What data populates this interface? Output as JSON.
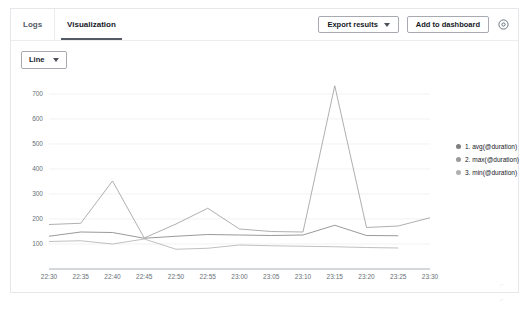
{
  "header": {
    "tabs": [
      {
        "label": "Logs",
        "active": false
      },
      {
        "label": "Visualization",
        "active": true
      }
    ],
    "export_button": "Export results",
    "dashboard_button": "Add to dashboard",
    "settings_icon": "gear-icon"
  },
  "controls": {
    "chart_type": "Line",
    "chart_type_caret": "chevron-down-icon"
  },
  "chart_data": {
    "type": "line",
    "title": "",
    "xlabel": "",
    "ylabel": "",
    "grid": true,
    "legend_position": "right",
    "ylim": [
      0,
      760
    ],
    "yticks": [
      100,
      200,
      300,
      400,
      500,
      600,
      700
    ],
    "x": [
      "22:30",
      "22:35",
      "22:40",
      "22:45",
      "22:50",
      "22:55",
      "23:00",
      "23:05",
      "23:10",
      "23:15",
      "23:20",
      "23:25",
      "23:30"
    ],
    "series": [
      {
        "name": "1. avg(@duration)",
        "color": "#7f7f7f",
        "values": [
          131,
          148,
          146,
          123,
          131,
          138,
          136,
          134,
          136,
          175,
          134,
          133,
          null
        ]
      },
      {
        "name": "2. max(@duration)",
        "color": "#9a9a9a",
        "values": [
          178,
          183,
          352,
          124,
          180,
          243,
          160,
          150,
          148,
          733,
          166,
          172,
          205
        ]
      },
      {
        "name": "3. min(@duration)",
        "color": "#b0b0b0",
        "values": [
          110,
          113,
          100,
          120,
          79,
          83,
          96,
          93,
          91,
          89,
          86,
          84,
          null
        ]
      }
    ],
    "legend": [
      {
        "label": "1. avg(@duration)",
        "color": "#7f7f7f"
      },
      {
        "label": "2. max(@duration)",
        "color": "#9a9a9a"
      },
      {
        "label": "3. min(@duration)",
        "color": "#b0b0b0"
      }
    ]
  },
  "watermark": {
    "mark_top": "⌐",
    "mark_bottom": "⌐"
  }
}
